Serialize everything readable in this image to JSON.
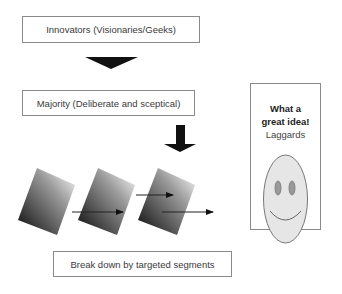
{
  "diagram": {
    "innovators_label": "Innovators (Visionaries/Geeks)",
    "majority_label": "Majority (Deliberate and sceptical)",
    "laggards": {
      "line1": "What a",
      "line2": "great idea!",
      "line3": "Laggards"
    },
    "segments_label": "Break down by targeted segments",
    "icons": [
      "down-triangle-arrow",
      "down-block-arrow",
      "gradient-segment",
      "right-arrow",
      "smiley-face"
    ],
    "colors": {
      "border": "#8a8a8a",
      "arrow": "#111111",
      "face_fill": "#e6e6e6",
      "face_stroke": "#777777",
      "eye_fill": "#999999"
    }
  }
}
